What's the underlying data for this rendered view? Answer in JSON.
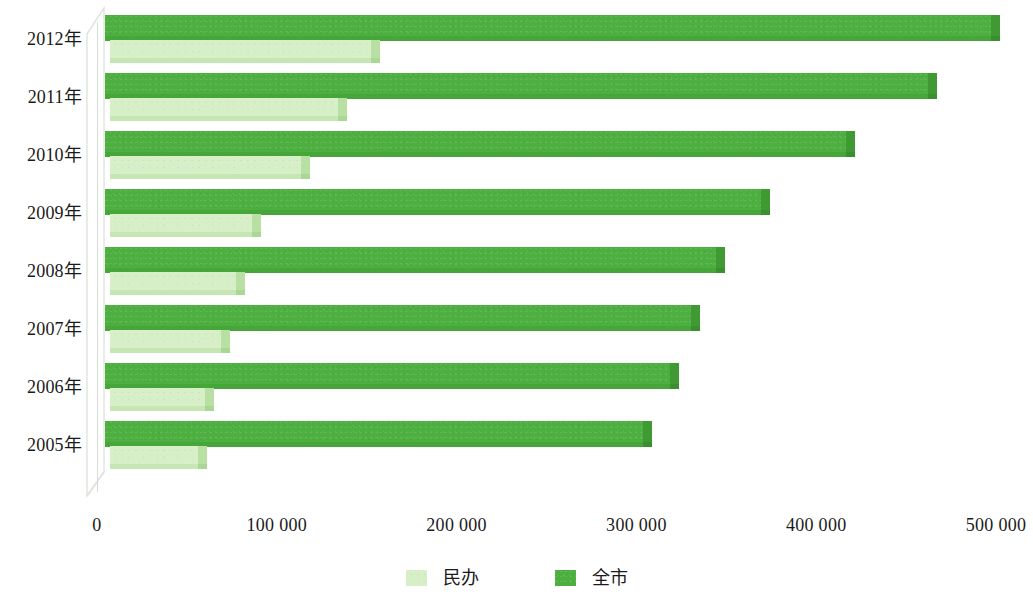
{
  "chart_data": {
    "type": "bar",
    "orientation": "horizontal",
    "title": "",
    "subtitle": "",
    "xlabel": "",
    "ylabel": "",
    "categories": [
      "2012年",
      "2011年",
      "2010年",
      "2009年",
      "2008年",
      "2007年",
      "2006年",
      "2005年"
    ],
    "series": [
      {
        "name": "民办",
        "color": "#d6efc7",
        "values": [
          145000,
          127000,
          106000,
          79000,
          70000,
          62000,
          53000,
          49000
        ]
      },
      {
        "name": "全市",
        "color": "#4daf3f",
        "values": [
          493000,
          458000,
          412000,
          365000,
          340000,
          326000,
          314000,
          299000
        ]
      }
    ],
    "xlim": [
      0,
      500000
    ],
    "xticks": [
      0,
      100000,
      200000,
      300000,
      400000,
      500000
    ],
    "xtick_labels": [
      "0",
      "100 000",
      "200 000",
      "300 000",
      "400 000",
      "500 000"
    ],
    "grid": false,
    "legend_position": "bottom"
  },
  "axis": {
    "ticks": [
      {
        "label": "0",
        "value": 0
      },
      {
        "label": "100 000",
        "value": 100000
      },
      {
        "label": "200 000",
        "value": 200000
      },
      {
        "label": "300 000",
        "value": 300000
      },
      {
        "label": "400 000",
        "value": 400000
      },
      {
        "label": "500 000",
        "value": 500000
      }
    ]
  },
  "legend": {
    "items": [
      {
        "label": "民办",
        "color": "#d6efc7"
      },
      {
        "label": "全市",
        "color": "#4daf3f"
      }
    ]
  },
  "rows": [
    {
      "label": "2012年",
      "private": 145000,
      "total": 493000
    },
    {
      "label": "2011年",
      "private": 127000,
      "total": 458000
    },
    {
      "label": "2010年",
      "private": 106000,
      "total": 412000
    },
    {
      "label": "2009年",
      "private": 79000,
      "total": 365000
    },
    {
      "label": "2008年",
      "private": 70000,
      "total": 340000
    },
    {
      "label": "2007年",
      "private": 62000,
      "total": 326000
    },
    {
      "label": "2006年",
      "private": 53000,
      "total": 314000
    },
    {
      "label": "2005年",
      "private": 49000,
      "total": 299000
    }
  ]
}
